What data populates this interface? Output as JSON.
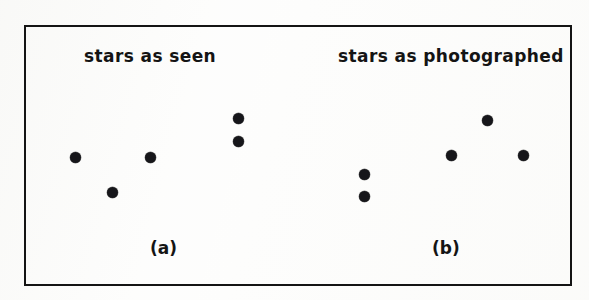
{
  "figure": {
    "background_color": "#fdfdfc",
    "frame_color": "#141414",
    "dot_color": "#16161a",
    "panels": [
      {
        "id": "a",
        "heading": "stars as seen",
        "caption": "(a)",
        "stars": [
          {
            "name": "star-1",
            "x": 49,
            "y": 130
          },
          {
            "name": "star-2",
            "x": 86,
            "y": 165
          },
          {
            "name": "star-3",
            "x": 124,
            "y": 130
          },
          {
            "name": "star-4",
            "x": 212,
            "y": 91
          },
          {
            "name": "star-5",
            "x": 212,
            "y": 114
          }
        ]
      },
      {
        "id": "b",
        "heading": "stars as photographed",
        "caption": "(b)",
        "stars": [
          {
            "name": "star-1",
            "x": 44,
            "y": 147
          },
          {
            "name": "star-2",
            "x": 44,
            "y": 169
          },
          {
            "name": "star-3",
            "x": 131,
            "y": 128
          },
          {
            "name": "star-4",
            "x": 167,
            "y": 93
          },
          {
            "name": "star-5",
            "x": 203,
            "y": 128
          }
        ]
      }
    ]
  }
}
